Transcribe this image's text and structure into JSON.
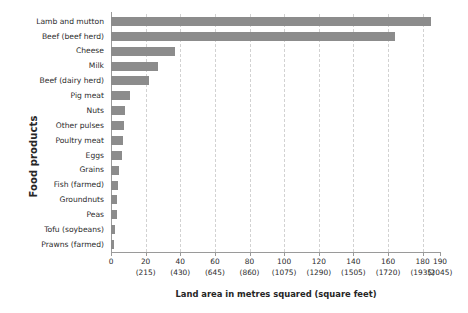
{
  "chart_data": {
    "type": "bar",
    "orientation": "horizontal",
    "title": "",
    "xlabel": "Land area in metres squared (square feet)",
    "ylabel": "Food products",
    "xlim": [
      0,
      190
    ],
    "grid": true,
    "legend": false,
    "bar_color": "#8c8c8c",
    "gridline_color": "#d2d2d2",
    "axis_color": "#9a9a9a",
    "categories": [
      "Lamb and mutton",
      "Beef (beef herd)",
      "Cheese",
      "Milk",
      "Beef (dairy herd)",
      "Pig meat",
      "Nuts",
      "Other pulses",
      "Poultry meat",
      "Eggs",
      "Grains",
      "Fish (farmed)",
      "Groundnuts",
      "Peas",
      "Tofu (soybeans)",
      "Prawns (farmed)"
    ],
    "values": [
      185,
      164,
      37,
      27,
      22,
      11,
      7.9,
      7.3,
      7.1,
      6.3,
      4.6,
      4.1,
      3.5,
      3.4,
      2.2,
      2.0
    ],
    "xticks": [
      0,
      20,
      40,
      60,
      80,
      100,
      120,
      140,
      160,
      180,
      190
    ],
    "xtick_labels": [
      "0",
      "20",
      "40",
      "60",
      "80",
      "100",
      "120",
      "140",
      "160",
      "180",
      "190"
    ],
    "xtick_sublabels": [
      "",
      "(215)",
      "(430)",
      "(645)",
      "(860)",
      "(1075)",
      "(1290)",
      "(1505)",
      "(1720)",
      "(1935)",
      "(2045)"
    ],
    "gridline_values": [
      20,
      40,
      60,
      80,
      100,
      120,
      140,
      160,
      180
    ]
  }
}
